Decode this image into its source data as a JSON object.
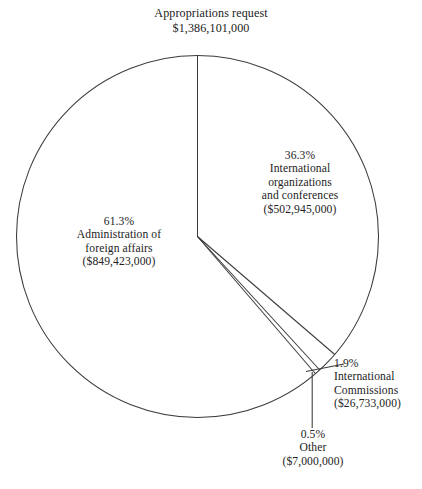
{
  "chart_data": {
    "type": "pie",
    "title": "Appropriations request",
    "subtitle": "$1,386,101,000",
    "total_value": 1386101000,
    "total_label": "$1,386,101,000",
    "units": "US dollars",
    "legend": "none",
    "grid": false,
    "start_angle_deg": 0,
    "direction": "clockwise",
    "categories": [
      "International organizations and conferences",
      "International Commissions",
      "Other",
      "Administration of foreign affairs"
    ],
    "values": [
      502945000,
      26733000,
      7000000,
      849423000
    ],
    "percentages": [
      36.3,
      1.9,
      0.5,
      61.3
    ],
    "slices": [
      {
        "id": "intl-orgs",
        "percent_label": "36.3%",
        "percent": 36.3,
        "name_lines": [
          "International",
          "organizations",
          "and conferences"
        ],
        "value_label": "($502,945,000)",
        "value": 502945000,
        "sweep_deg": 130.68
      },
      {
        "id": "intl-commissions",
        "percent_label": "1.9%",
        "percent": 1.9,
        "name_lines": [
          "International",
          "Commissions"
        ],
        "value_label": "($26,733,000)",
        "value": 26733000,
        "sweep_deg": 6.84
      },
      {
        "id": "other",
        "percent_label": "0.5%",
        "percent": 0.5,
        "name_lines": [
          "Other"
        ],
        "value_label": "($7,000,000)",
        "value": 7000000,
        "sweep_deg": 1.8
      },
      {
        "id": "administration",
        "percent_label": "61.3%",
        "percent": 61.3,
        "name_lines": [
          "Administration of",
          "foreign affairs"
        ],
        "value_label": "($849,423,000)",
        "value": 849423000,
        "sweep_deg": 220.68
      }
    ]
  },
  "title": {
    "line1": "Appropriations request",
    "line2": "$1,386,101,000"
  },
  "labels": {
    "admin": {
      "percent": "61.3%",
      "name1": "Administration of",
      "name2": "foreign affairs",
      "value": "($849,423,000)"
    },
    "intl_orgs": {
      "percent": "36.3%",
      "name1": "International",
      "name2": "organizations",
      "name3": "and conferences",
      "value": "($502,945,000)"
    },
    "intl_commissions": {
      "percent": "1.9%",
      "name1": "International",
      "name2": "Commissions",
      "value": "($26,733,000)"
    },
    "other": {
      "percent": "0.5%",
      "name1": "Other",
      "value": "($7,000,000)"
    }
  },
  "style": {
    "stroke_color": "#3b3b3b",
    "text_color": "#232323",
    "fill_color": "#ffffff"
  }
}
